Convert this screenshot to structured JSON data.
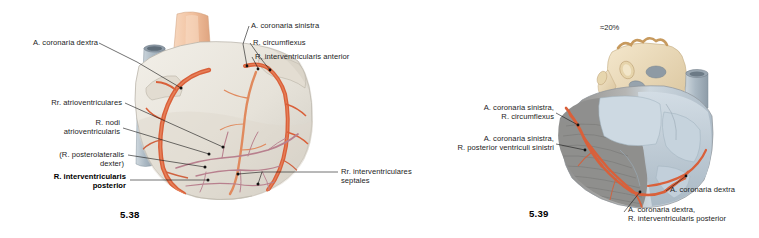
{
  "page": {
    "background": "#ffffff",
    "width": 759,
    "height": 238
  },
  "palette": {
    "artery": "#d9603a",
    "artery_dark": "#b8472a",
    "vein_mauve": "#b8808e",
    "myocardium_pale": "#e8e4dc",
    "myocardium_gray": "#9a9a98",
    "vessel_blue": "#b9c5cf",
    "aorta_peach": "#f0c5a6",
    "bone_cream": "#ebdcbd",
    "leader_line": "#1a1a1a",
    "text": "#1d1d1d"
  },
  "figures": [
    {
      "id": "fig-5-38",
      "number": "5.38",
      "view": "anterior view of the heart with coronary arteries",
      "labels": [
        {
          "key": "a-coronaria-dextra",
          "text": "A. coronaria dextra",
          "bold": false,
          "align": "right"
        },
        {
          "key": "a-coronaria-sinistra",
          "text": "A. coronaria sinistra",
          "bold": false,
          "align": "left"
        },
        {
          "key": "r-circumflexus",
          "text": "R. circumflexus",
          "bold": false,
          "align": "left"
        },
        {
          "key": "r-interventricularis-anterior",
          "text": "R. interventricularis anterior",
          "bold": false,
          "align": "left"
        },
        {
          "key": "rr-atrioventriculares",
          "text": "Rr. atrioventriculares",
          "bold": false,
          "align": "right"
        },
        {
          "key": "r-nodi-atrioventricularis",
          "text": "R. nodi\natrioventricularis",
          "bold": false,
          "align": "right"
        },
        {
          "key": "r-posterolateralis-dexter",
          "text": "(R. posterolateralis\ndexter)",
          "bold": false,
          "align": "right"
        },
        {
          "key": "r-interventricularis-posterior",
          "text": "R. interventricularis\nposterior",
          "bold": true,
          "align": "right"
        },
        {
          "key": "rr-interventriculares-septales",
          "text": "Rr. interventriculares\nseptales",
          "bold": false,
          "align": "left"
        }
      ]
    },
    {
      "id": "fig-5-39",
      "number": "5.39",
      "view": "posterior view of the heart with coronary arteries",
      "percentage_marker": "≈20%",
      "labels": [
        {
          "key": "a-coronaria-sinistra-r-circumflexus",
          "text": "A. coronaria sinistra,\nR. circumflexus",
          "bold": false,
          "align": "right"
        },
        {
          "key": "a-coronaria-sinistra-r-posterior-ventriculi-sinistri",
          "text": "A. coronaria sinistra,\nR. posterior ventriculi sinistri",
          "bold": false,
          "align": "right"
        },
        {
          "key": "a-coronaria-dextra-right",
          "text": "A. coronaria dextra",
          "bold": false,
          "align": "left"
        },
        {
          "key": "a-coronaria-dextra-r-interventricularis-posterior",
          "text": "A. coronaria dextra,\nR. interventricularis posterior",
          "bold": false,
          "align": "left"
        }
      ]
    }
  ]
}
